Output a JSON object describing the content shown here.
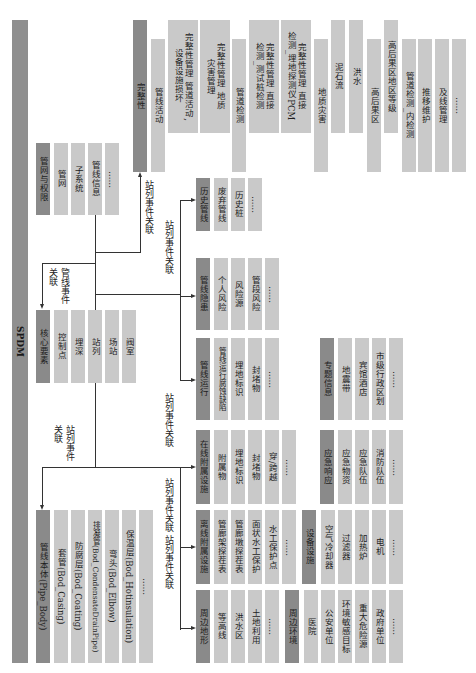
{
  "diagram": {
    "orientation": "rotated 90deg clockwise",
    "root": "SPDM",
    "groups": {
      "pipe_network": {
        "header": "管网与权限",
        "items": [
          "管网",
          "子系统",
          "管线信息",
          "……"
        ]
      },
      "core_elements": {
        "header": "核心要素",
        "items": [
          "控制点",
          "埋深",
          "站列",
          "场站",
          "阀室"
        ]
      },
      "pipe_body": {
        "header": "管线本体(Pipe_Body)",
        "items": [
          "套管(Bod_Casing)",
          "防腐层(Bod_Coating)",
          "排凝管(Bod_CondensateDrainPipe)",
          "弯头(Bod_Elbow)",
          "保温层(Bod_Hotinsulation)",
          "……"
        ]
      },
      "integrity": {
        "header": "完整性"
      },
      "pipeline_activity": {
        "header": "管线活动",
        "items": [
          "完整性管理_管道活动,\n设备设施损坏",
          "完整性管理_地质\n灾害管理"
        ]
      },
      "pipe_inspection": {
        "header": "管道检测",
        "items": [
          "完整性管理_直接\n检测_测试桩检测",
          "完整性管理_直接\n检测_埋地探测仪PCM"
        ]
      },
      "geo_hazard": {
        "header": "地质灾害",
        "items": [
          "泥石流",
          "洪水"
        ]
      },
      "hca": {
        "header": "高后果区",
        "items": [
          "高后果区地区等级"
        ]
      },
      "integrity_misc": {
        "items": [
          "管道检测_内检测",
          "推移维护",
          "及线管理",
          "……"
        ]
      },
      "history": {
        "header": "历史管线",
        "items": [
          "废弃管线",
          "历史桩",
          "……"
        ]
      },
      "hazard": {
        "header": "管线隐患",
        "items": [
          "个人风险",
          "风险源",
          "管段风险",
          "……"
        ]
      },
      "operation": {
        "header": "管线运行",
        "items": [
          "管线运行腐蚀缺陷",
          "埋地标识",
          "封堵物",
          "……"
        ]
      },
      "online_facility": {
        "header": "在线附属设施",
        "items": [
          "附属物",
          "埋地标识",
          "封堵物",
          "穿/跨越",
          "……"
        ]
      },
      "offline_facility": {
        "header": "离线附属设施",
        "items": [
          "管廊架探茬表",
          "管廊墩探茬表",
          "面状水工保护",
          "水工保护点",
          "……"
        ]
      },
      "terrain": {
        "header": "周边地形",
        "items": [
          "等高线",
          "洪水区",
          "土地利用",
          "……"
        ]
      },
      "environment": {
        "header": "周边环境",
        "items": [
          "医院",
          "公安单位",
          "环境敏感目标",
          "重大危险源",
          "政府单位",
          "……"
        ]
      },
      "equipment": {
        "header": "设备设施",
        "items": [
          "空气冷却器",
          "过滤器",
          "加热炉",
          "电机",
          "……"
        ]
      },
      "emergency": {
        "header": "应急响应",
        "items": [
          "应急物资",
          "应急队伍",
          "消防队伍",
          "……"
        ]
      },
      "thematic": {
        "header": "专题信息",
        "items": [
          "地震带",
          "宾馆酒店",
          "市级行政区划",
          "……"
        ]
      }
    },
    "labels": {
      "pipe_event_link": "管线事件\n关联",
      "station_event_link_1": "站列事件\n关联",
      "station_event_link_2": "站列事件关联",
      "station_event_link_3": "站列事件关联",
      "station_event_link_4": "站列事件关联",
      "station_event_link_5": "站列事件关联",
      "station_event_link_6": "站列事件关联"
    }
  }
}
